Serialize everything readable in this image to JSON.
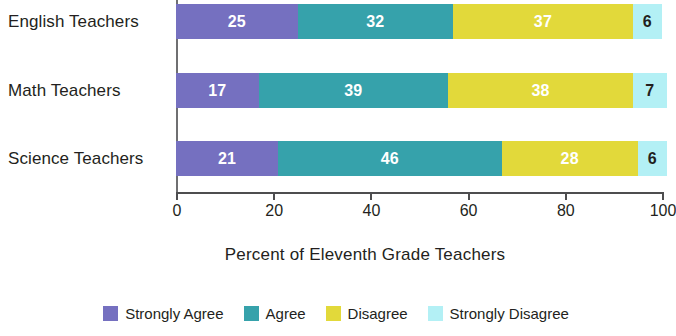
{
  "chart_data": {
    "type": "bar",
    "subtype": "stacked-horizontal-100",
    "title": "",
    "xlabel": "Percent of Eleventh Grade Teachers",
    "ylabel": "",
    "categories": [
      "English Teachers",
      "Math Teachers",
      "Science Teachers"
    ],
    "series": [
      {
        "name": "Strongly Agree",
        "color": "#7570c0",
        "values": [
          25,
          17,
          21
        ]
      },
      {
        "name": "Agree",
        "color": "#36a2ab",
        "values": [
          32,
          39,
          46
        ]
      },
      {
        "name": "Disagree",
        "color": "#e2d93a",
        "values": [
          37,
          38,
          28
        ]
      },
      {
        "name": "Strongly Disagree",
        "color": "#b3f0f5",
        "values": [
          6,
          7,
          6
        ]
      }
    ],
    "xlim": [
      0,
      100
    ],
    "xticks": [
      0,
      20,
      40,
      60,
      80,
      100
    ],
    "xtick_labels": [
      "0",
      "20",
      "40",
      "60",
      "80",
      "100"
    ],
    "grid": false,
    "legend_position": "bottom",
    "value_label_colors": {
      "Strongly Agree": "#ffffff",
      "Agree": "#ffffff",
      "Disagree": "#ffffff",
      "Strongly Disagree": "#231f20"
    }
  },
  "legend": {
    "items": [
      {
        "label": "Strongly Agree",
        "color": "#7570c0"
      },
      {
        "label": "Agree",
        "color": "#36a2ab"
      },
      {
        "label": "Disagree",
        "color": "#e2d93a"
      },
      {
        "label": "Strongly Disagree",
        "color": "#b3f0f5"
      }
    ]
  }
}
